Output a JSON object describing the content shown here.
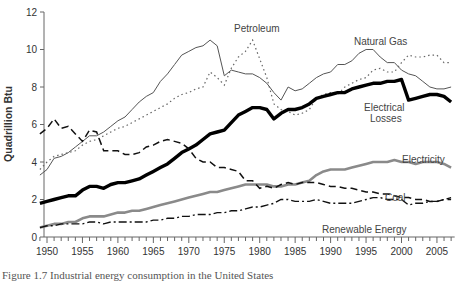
{
  "chart_data": {
    "type": "line",
    "title": "",
    "xlabel": "",
    "ylabel": "Quadrillion Btu",
    "ylim": [
      0,
      12
    ],
    "xlim": [
      1949,
      2007
    ],
    "grid": false,
    "legend": "inline labels",
    "y_ticks": [
      "0",
      "2",
      "4",
      "6",
      "8",
      "10",
      "12"
    ],
    "x_ticks": [
      "1950",
      "1955",
      "1960",
      "1965",
      "1970",
      "1975",
      "1980",
      "1985",
      "1990",
      "1995",
      "2000",
      "2005"
    ],
    "x": [
      1949,
      1950,
      1951,
      1952,
      1953,
      1954,
      1955,
      1956,
      1957,
      1958,
      1959,
      1960,
      1961,
      1962,
      1963,
      1964,
      1965,
      1966,
      1967,
      1968,
      1969,
      1970,
      1971,
      1972,
      1973,
      1974,
      1975,
      1976,
      1977,
      1978,
      1979,
      1980,
      1981,
      1982,
      1983,
      1984,
      1985,
      1986,
      1987,
      1988,
      1989,
      1990,
      1991,
      1992,
      1993,
      1994,
      1995,
      1996,
      1997,
      1998,
      1999,
      2000,
      2001,
      2002,
      2003,
      2004,
      2005,
      2006,
      2007
    ],
    "series": [
      {
        "name": "Natural Gas",
        "style": "thin solid",
        "label": "Natural Gas",
        "values": [
          3.3,
          3.6,
          4.2,
          4.3,
          4.5,
          4.8,
          5.1,
          5.4,
          5.4,
          5.6,
          5.9,
          6.2,
          6.4,
          6.8,
          7.2,
          7.5,
          7.7,
          8.3,
          8.7,
          9.2,
          9.7,
          9.9,
          10.1,
          10.2,
          10.5,
          10.2,
          8.6,
          8.9,
          8.8,
          8.7,
          8.7,
          8.5,
          8.2,
          7.7,
          7.3,
          8.0,
          7.8,
          7.9,
          8.2,
          8.5,
          8.7,
          8.8,
          9.2,
          9.2,
          9.4,
          9.8,
          10.0,
          10.0,
          9.6,
          9.3,
          9.3,
          8.9,
          8.7,
          8.6,
          8.3,
          8.0,
          7.9,
          7.9,
          8.0
        ]
      },
      {
        "name": "Petroleum",
        "style": "dotted",
        "label": "Petroleum",
        "values": [
          3.6,
          4.0,
          4.3,
          4.4,
          4.5,
          4.6,
          4.9,
          5.1,
          5.2,
          5.4,
          5.6,
          5.8,
          5.9,
          6.1,
          6.3,
          6.5,
          6.7,
          6.9,
          7.1,
          7.4,
          7.6,
          7.7,
          7.9,
          8.0,
          8.8,
          8.5,
          8.1,
          9.0,
          9.6,
          9.9,
          10.5,
          9.5,
          8.5,
          7.1,
          6.8,
          6.7,
          6.5,
          6.6,
          6.8,
          7.4,
          7.6,
          7.7,
          7.6,
          8.0,
          8.2,
          8.4,
          8.5,
          8.9,
          9.0,
          8.8,
          8.8,
          9.3,
          9.7,
          9.6,
          9.6,
          9.7,
          9.7,
          9.3,
          9.3
        ]
      },
      {
        "name": "Electrical Losses",
        "style": "thick solid",
        "label": "Electrical Losses",
        "values": [
          1.8,
          1.9,
          2.0,
          2.1,
          2.2,
          2.2,
          2.5,
          2.7,
          2.7,
          2.6,
          2.8,
          2.9,
          2.9,
          3.0,
          3.1,
          3.3,
          3.5,
          3.7,
          3.9,
          4.2,
          4.5,
          4.7,
          4.9,
          5.2,
          5.5,
          5.6,
          5.7,
          6.1,
          6.5,
          6.7,
          6.9,
          6.9,
          6.8,
          6.3,
          6.6,
          6.8,
          6.8,
          6.9,
          7.1,
          7.4,
          7.5,
          7.6,
          7.7,
          7.7,
          7.9,
          8.0,
          8.1,
          8.2,
          8.2,
          8.3,
          8.3,
          8.4,
          7.3,
          7.4,
          7.5,
          7.6,
          7.6,
          7.5,
          7.2
        ]
      },
      {
        "name": "Electricity",
        "style": "thick gray",
        "label": "Electricity",
        "values": [
          0.5,
          0.6,
          0.7,
          0.7,
          0.8,
          0.8,
          1.0,
          1.1,
          1.1,
          1.1,
          1.2,
          1.3,
          1.3,
          1.4,
          1.4,
          1.5,
          1.6,
          1.7,
          1.8,
          1.9,
          2.0,
          2.1,
          2.2,
          2.3,
          2.4,
          2.4,
          2.5,
          2.6,
          2.7,
          2.8,
          2.8,
          2.8,
          2.8,
          2.7,
          2.7,
          2.8,
          2.8,
          2.9,
          3.0,
          3.3,
          3.5,
          3.6,
          3.6,
          3.6,
          3.7,
          3.8,
          3.9,
          4.0,
          4.0,
          4.0,
          4.1,
          4.0,
          4.0,
          3.9,
          4.0,
          4.0,
          4.0,
          3.9,
          3.7
        ]
      },
      {
        "name": "Coal",
        "style": "dashed",
        "label": "Coal",
        "values": [
          5.5,
          5.8,
          6.3,
          5.8,
          5.9,
          5.5,
          5.1,
          5.7,
          5.6,
          4.6,
          4.6,
          4.6,
          4.4,
          4.4,
          4.5,
          4.8,
          4.9,
          5.1,
          5.2,
          5.1,
          5.0,
          4.7,
          4.2,
          4.0,
          4.0,
          3.7,
          3.7,
          3.6,
          3.5,
          3.0,
          3.0,
          2.6,
          2.7,
          2.6,
          2.8,
          2.9,
          2.8,
          2.9,
          2.9,
          2.9,
          2.8,
          2.7,
          2.7,
          2.6,
          2.6,
          2.5,
          2.4,
          2.4,
          2.3,
          2.3,
          2.2,
          2.1,
          2.1,
          2.0,
          2.0,
          1.9,
          1.9,
          2.0,
          2.0
        ]
      },
      {
        "name": "Renewable Energy",
        "style": "dash-dot",
        "label": "Renewable Energy",
        "values": [
          0.5,
          0.6,
          0.6,
          0.7,
          0.7,
          0.7,
          0.7,
          0.8,
          0.8,
          0.7,
          0.8,
          0.8,
          0.8,
          0.8,
          0.8,
          0.8,
          0.9,
          0.9,
          1.0,
          1.0,
          1.1,
          1.1,
          1.2,
          1.2,
          1.2,
          1.3,
          1.3,
          1.4,
          1.4,
          1.5,
          1.6,
          1.6,
          1.7,
          1.8,
          2.0,
          2.0,
          1.9,
          1.9,
          1.9,
          2.0,
          1.9,
          1.8,
          1.8,
          1.8,
          1.8,
          1.9,
          2.0,
          2.1,
          2.1,
          2.0,
          2.0,
          2.0,
          1.7,
          1.8,
          1.8,
          1.9,
          1.9,
          2.0,
          2.1
        ]
      }
    ]
  },
  "caption": "Figure 1.7 Industrial energy consumption in the United States"
}
